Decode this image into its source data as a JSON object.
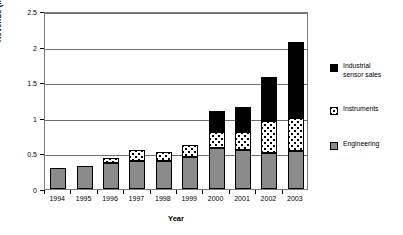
{
  "chart_data": {
    "type": "bar",
    "subtype": "stacked-bar",
    "title": "",
    "xlabel": "Year",
    "ylabel": "Revenue (million CHF)",
    "ylim": [
      0,
      2.5
    ],
    "yticks": [
      0,
      0.5,
      1,
      1.5,
      2,
      2.5
    ],
    "ytick_labels": [
      "0",
      "0.5",
      "1",
      "1.5",
      "2",
      "2.5"
    ],
    "grid": true,
    "grid_axis": "y",
    "legend_position": "right",
    "categories": [
      "1994",
      "1995",
      "1996",
      "1997",
      "1998",
      "1999",
      "2000",
      "2001",
      "2002",
      "2003"
    ],
    "series": [
      {
        "name": "Engineering",
        "color": "#8b8b8b",
        "pattern": "solid-gray",
        "values": [
          0.3,
          0.33,
          0.37,
          0.4,
          0.4,
          0.45,
          0.57,
          0.55,
          0.5,
          0.53
        ]
      },
      {
        "name": "Instruments",
        "color": "#ffffff",
        "pattern": "dotted",
        "values": [
          0.0,
          0.0,
          0.07,
          0.15,
          0.12,
          0.17,
          0.23,
          0.25,
          0.45,
          0.47
        ]
      },
      {
        "name": "Industrial sensor sales",
        "color": "#000000",
        "pattern": "solid-black",
        "values": [
          0.0,
          0.0,
          0.0,
          0.0,
          0.0,
          0.0,
          0.3,
          0.35,
          0.63,
          1.07
        ]
      }
    ],
    "totals": [
      0.3,
      0.33,
      0.44,
      0.55,
      0.52,
      0.62,
      1.1,
      1.15,
      1.58,
      2.07
    ]
  },
  "legend": {
    "items": [
      {
        "label_line1": "Industrial",
        "label_line2": "sensor sales"
      },
      {
        "label_line1": "Instruments",
        "label_line2": ""
      },
      {
        "label_line1": "Engineering",
        "label_line2": ""
      }
    ]
  }
}
